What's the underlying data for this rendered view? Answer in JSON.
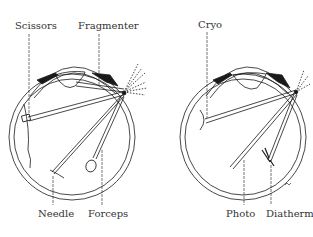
{
  "left_panel": {
    "labels": {
      "scissors": "Scissors",
      "fragmenter": "Fragmenter",
      "needle": "Needle",
      "forceps": "Forceps"
    }
  },
  "right_panel": {
    "labels": {
      "cryo": "Cryo",
      "photo": "Photo",
      "diathermy": "Diathermy"
    }
  },
  "colors": {
    "line": "#1a1a1a",
    "background": "#ffffff"
  }
}
